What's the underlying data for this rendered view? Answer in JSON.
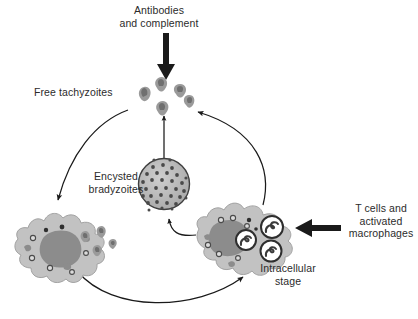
{
  "figure": {
    "background_color": "#ffffff",
    "width": 418,
    "height": 319
  },
  "labels": {
    "antibodies": "Antibodies\nand complement",
    "free_tachyzoites": "Free tachyzoites",
    "encysted_bradyzoites": "Encysted\nbradyzoites",
    "t_cells": "T cells and\nactivated\nmacrophages",
    "intracellular_stage": "Intracellular\nstage"
  },
  "colors": {
    "text": "#2b2b2b",
    "arrow_thin": "#1a1a1a",
    "arrow_thick": "#1a1a1a",
    "cell_body": "#c2c2c2",
    "cell_outline": "#9a9a9a",
    "nucleus": "#8c8c8c",
    "parasite": "#949494",
    "parasite_dark": "#6e6e6e",
    "cyst_fill": "#b5b5b5",
    "cyst_outline": "#4a4a4a",
    "bradyzoite_dot": "#4d4d4d",
    "vacuole": "#ffffff",
    "vacuole_outline": "#2e2e2e",
    "granule_outline": "#4a4a4a"
  },
  "elements": {
    "free_tachyzoite_cluster": {
      "name": "Free tachyzoites",
      "count": 5,
      "shape": "crescent"
    },
    "tissue_cyst": {
      "name": "Encysted bradyzoites",
      "shape": "circle",
      "bradyzoite_count": 34
    },
    "infected_cell_left": {
      "name": "Ruptured host cell releasing tachyzoites",
      "released_parasite_count": 4
    },
    "infected_cell_right": {
      "name": "Intracellular stage host cell",
      "vacuole_count": 3
    }
  },
  "arrows": {
    "antibodies_to_tachyzoites": {
      "style": "thick",
      "direction": "down",
      "meaning": "Antibodies and complement act on free tachyzoites"
    },
    "tcells_to_infected_cell": {
      "style": "thick",
      "direction": "left",
      "meaning": "T cells and activated macrophages act on intracellular stage"
    },
    "tachyzoites_to_left_cell": {
      "style": "thin-curved",
      "direction": "down-left",
      "meaning": "Free tachyzoites invade host cell"
    },
    "left_cell_to_right_cell": {
      "style": "thin-curved",
      "direction": "right",
      "meaning": "Cycle continues to intracellular stage"
    },
    "right_cell_to_tachyzoites": {
      "style": "thin-curved",
      "direction": "up-left",
      "meaning": "Intracellular stage releases free tachyzoites"
    },
    "right_cell_to_cyst": {
      "style": "thin-curved-short",
      "direction": "up-left",
      "meaning": "Intracellular stage converts to encysted bradyzoites"
    },
    "cyst_to_tachyzoites": {
      "style": "thin-straight",
      "direction": "up",
      "meaning": "Bradyzoites reactivate to free tachyzoites"
    }
  }
}
